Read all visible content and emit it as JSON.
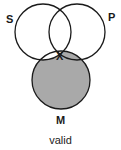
{
  "diagram": {
    "type": "venn-3",
    "circles": [
      {
        "id": "S",
        "label": "S",
        "cx": 43,
        "cy": 32,
        "r": 28
      },
      {
        "id": "P",
        "label": "P",
        "cx": 77,
        "cy": 32,
        "r": 28
      },
      {
        "id": "M",
        "label": "M",
        "cx": 61,
        "cy": 80,
        "r": 29
      }
    ],
    "shaded_regions": [
      "M only",
      "P∩M not S"
    ],
    "marker": {
      "symbol": "X",
      "region": "S∩P∩M"
    },
    "caption": "valid",
    "colors": {
      "shade": "#a9a9a9",
      "stroke": "#1a1a1a",
      "background": "#ffffff"
    }
  }
}
